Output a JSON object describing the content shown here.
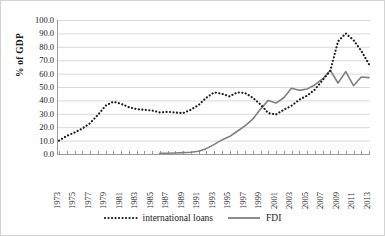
{
  "chart_data": {
    "type": "line",
    "title": "",
    "xlabel": "",
    "ylabel": "% of GDP",
    "ylim": [
      0,
      100
    ],
    "ytick_step": 10,
    "ytick_labels": [
      "0.0",
      "10.0",
      "20.0",
      "30.0",
      "40.0",
      "50.0",
      "60.0",
      "70.0",
      "80.0",
      "90.0",
      "100.0"
    ],
    "xlim": [
      1973,
      2013
    ],
    "xtick_labels": [
      "1973",
      "1975",
      "1977",
      "1979",
      "1981",
      "1983",
      "1985",
      "1987",
      "1989",
      "1991",
      "1993",
      "1995",
      "1997",
      "1999",
      "2001",
      "2003",
      "2005",
      "2007",
      "2009",
      "2011",
      "2013"
    ],
    "grid": "horizontal",
    "legend_position": "bottom",
    "x": [
      1973,
      1974,
      1975,
      1976,
      1977,
      1978,
      1979,
      1980,
      1981,
      1982,
      1983,
      1984,
      1985,
      1986,
      1987,
      1988,
      1989,
      1990,
      1991,
      1992,
      1993,
      1994,
      1995,
      1996,
      1997,
      1998,
      1999,
      2000,
      2001,
      2002,
      2003,
      2004,
      2005,
      2006,
      2007,
      2008,
      2009,
      2010,
      2011,
      2012,
      2013
    ],
    "series": [
      {
        "name": "international loans",
        "style": "dotted",
        "color": "#1a1a1a",
        "values": [
          10.0,
          13.5,
          16.0,
          19.0,
          23.0,
          29.0,
          36.0,
          39.0,
          37.5,
          35.0,
          33.5,
          33.0,
          32.5,
          31.0,
          31.5,
          31.0,
          30.5,
          33.0,
          36.5,
          42.0,
          46.0,
          45.0,
          43.0,
          46.0,
          45.5,
          42.0,
          37.0,
          30.5,
          29.5,
          33.0,
          36.0,
          40.5,
          43.5,
          48.0,
          55.0,
          62.0,
          84.0,
          90.0,
          85.0,
          77.0,
          67.0
        ]
      },
      {
        "name": "FDI",
        "style": "solid",
        "color": "#808080",
        "values": [
          null,
          null,
          null,
          null,
          null,
          null,
          null,
          null,
          null,
          null,
          null,
          null,
          null,
          0.5,
          0.6,
          0.8,
          1.0,
          1.3,
          2.0,
          4.0,
          7.0,
          10.5,
          13.0,
          17.0,
          21.0,
          26.0,
          33.5,
          40.0,
          38.0,
          42.0,
          49.0,
          47.5,
          48.5,
          51.5,
          56.0,
          62.5,
          53.0,
          61.5,
          51.0,
          57.5,
          57.0
        ]
      }
    ]
  },
  "legend": {
    "items": [
      {
        "label": "international loans",
        "marker": "dotted-line-swatch"
      },
      {
        "label": "FDI",
        "marker": "solid-line-swatch"
      }
    ]
  },
  "colors": {
    "loans": "#1a1a1a",
    "fdi": "#808080",
    "grid": "#d9d9d9",
    "axis": "#9a9a9a"
  }
}
